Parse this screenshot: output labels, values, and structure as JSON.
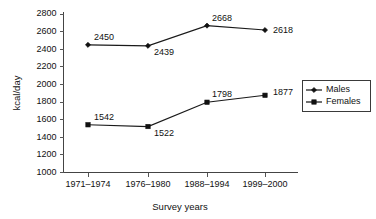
{
  "chart_data": {
    "type": "line",
    "title": "",
    "xlabel": "Survey years",
    "ylabel": "kcal/day",
    "categories": [
      "1971–1974",
      "1976–1980",
      "1988–1994",
      "1999–2000"
    ],
    "series": [
      {
        "name": "Males",
        "marker": "diamond",
        "color": "#111111",
        "values": [
          2450,
          2439,
          2668,
          2618
        ],
        "labels": [
          "2450",
          "2439",
          "2668",
          "2618"
        ]
      },
      {
        "name": "Females",
        "marker": "square",
        "color": "#111111",
        "values": [
          1542,
          1522,
          1798,
          1877
        ],
        "labels": [
          "1542",
          "1522",
          "1798",
          "1877"
        ]
      }
    ],
    "ylim": [
      1000,
      2800
    ],
    "ytick_step": 200,
    "ytick_labels": [
      "2800",
      "2600",
      "2400",
      "2200",
      "2000",
      "1800",
      "1600",
      "1400",
      "1200",
      "1000"
    ],
    "grid": false,
    "legend_position": "right"
  },
  "legend": {
    "entries": [
      {
        "label": "Males"
      },
      {
        "label": "Females"
      }
    ]
  }
}
